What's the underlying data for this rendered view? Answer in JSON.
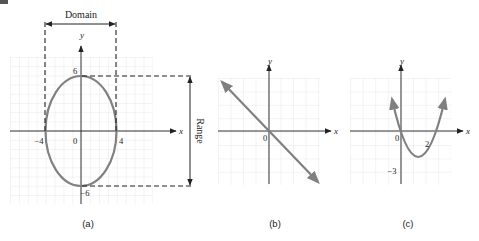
{
  "figure": {
    "colors": {
      "grid": "#e0e0e0",
      "axis": "#333333",
      "curve": "#808080",
      "dashed": "#222222",
      "text": "#222222"
    },
    "panels": [
      {
        "id": "a",
        "caption": "(a)",
        "x_axis_label": "x",
        "y_axis_label": "y",
        "origin_label": "0",
        "tick_labels": {
          "x_neg": "−4",
          "x_pos": "4",
          "y_pos": "6",
          "y_neg": "−6"
        },
        "domain_label": "Domain",
        "range_label": "Range",
        "curve": "ellipse",
        "equation_hint": "x^2/16 + y^2/36 = 1",
        "domain": "[-4, 4]",
        "range": "[-6, 6]"
      },
      {
        "id": "b",
        "caption": "(b)",
        "x_axis_label": "x",
        "y_axis_label": "y",
        "origin_label": "0",
        "curve": "line",
        "slope": -1
      },
      {
        "id": "c",
        "caption": "(c)",
        "x_axis_label": "x",
        "y_axis_label": "y",
        "origin_label": "0",
        "tick_labels": {
          "x_pos": "2",
          "y_neg": "−3"
        },
        "curve": "parabola",
        "vertex_y": -3
      }
    ]
  }
}
